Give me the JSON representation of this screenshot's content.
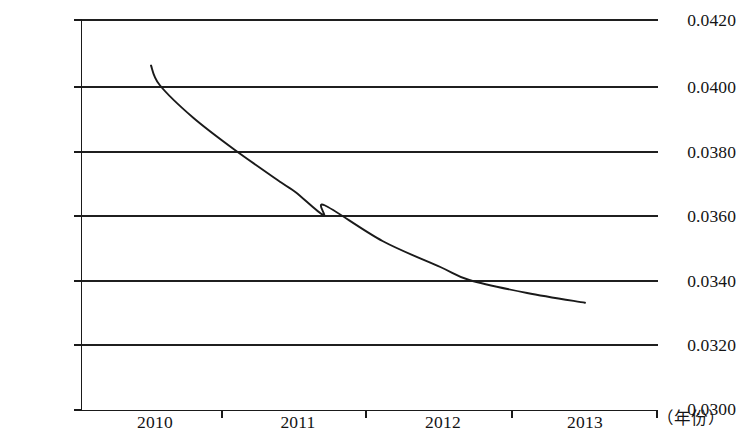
{
  "chart_data": {
    "type": "line",
    "title": "",
    "subtitle": "",
    "xlabel": "（年份）",
    "ylabel": "",
    "x": [
      2010,
      2011,
      2012,
      2013
    ],
    "categories": [
      "2010",
      "2011",
      "2012",
      "2013"
    ],
    "series": [
      {
        "name": "",
        "values": [
          0.0406,
          0.0371,
          0.0342,
          0.0333
        ]
      }
    ],
    "points": [
      {
        "x": 2010.0,
        "y": 0.0406
      },
      {
        "x": 2010.06,
        "y": 0.04
      },
      {
        "x": 2010.29,
        "y": 0.039
      },
      {
        "x": 2010.58,
        "y": 0.038
      },
      {
        "x": 2010.9,
        "y": 0.037
      },
      {
        "x": 2011.0,
        "y": 0.0367
      },
      {
        "x": 2011.2,
        "y": 0.0363
      },
      {
        "x": 2011.19,
        "y": 0.036
      },
      {
        "x": 2011.6,
        "y": 0.0352
      },
      {
        "x": 2012.0,
        "y": 0.0344
      },
      {
        "x": 2012.2,
        "y": 0.034
      },
      {
        "x": 2012.6,
        "y": 0.0336
      },
      {
        "x": 2013.0,
        "y": 0.0333
      }
    ],
    "ylim": [
      0.03,
      0.042
    ],
    "ytick_step": 0.002,
    "ytick_labels": [
      "0.0420",
      "0.0400",
      "0.0380",
      "0.0360",
      "0.0340",
      "0.0320",
      "0.0300"
    ],
    "ytick_values": [
      0.042,
      0.04,
      0.038,
      0.036,
      0.034,
      0.032,
      0.03
    ],
    "xtick_labels": [
      "2010",
      "2011",
      "2012",
      "2013"
    ],
    "grid": true,
    "grid_orientation": "horizontal",
    "legend": false,
    "legend_position": "none",
    "line_color": "#1a1a1a",
    "grid_color": "#1f1f1f",
    "axis_color": "#1a1a1a",
    "background_color": "#ffffff",
    "markers": false
  },
  "axis": {
    "y_labels": [
      {
        "text": "0.0420",
        "top": 12
      },
      {
        "text": "0.0400",
        "top": 79
      },
      {
        "text": "0.0380",
        "top": 144
      },
      {
        "text": "0.0360",
        "top": 208
      },
      {
        "text": "0.0340",
        "top": 273
      },
      {
        "text": "0.0320",
        "top": 337
      },
      {
        "text": "0.0300",
        "top": 401
      }
    ],
    "x_labels": [
      {
        "text": "2010",
        "left": 127
      },
      {
        "text": "2011",
        "left": 270
      },
      {
        "text": "2012",
        "left": 415
      },
      {
        "text": "2013",
        "left": 557
      }
    ],
    "x_unit": "（年份）"
  }
}
